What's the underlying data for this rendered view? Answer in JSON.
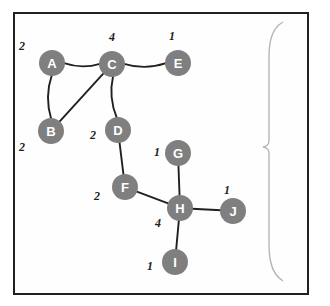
{
  "figure": {
    "side_label": "Whole graph network",
    "border_color": "#231f20",
    "node_color": "#7f7f7f",
    "node_text_color": "#ffffff",
    "edge_color": "#231f20",
    "background": "#ffffff"
  },
  "graph": {
    "type": "undirected-weighted-graph",
    "nodes": [
      {
        "id": "A",
        "label": "A",
        "x": 52,
        "y": 63,
        "degree_label": "2"
      },
      {
        "id": "B",
        "label": "B",
        "x": 51,
        "y": 131,
        "degree_label": "2"
      },
      {
        "id": "C",
        "label": "C",
        "x": 112,
        "y": 64,
        "degree_label": "4"
      },
      {
        "id": "D",
        "label": "D",
        "x": 118,
        "y": 130,
        "degree_label": "2"
      },
      {
        "id": "E",
        "label": "E",
        "x": 178,
        "y": 63,
        "degree_label": "1"
      },
      {
        "id": "F",
        "label": "F",
        "x": 125,
        "y": 187,
        "degree_label": "2"
      },
      {
        "id": "G",
        "label": "G",
        "x": 178,
        "y": 153,
        "degree_label": "1"
      },
      {
        "id": "H",
        "label": "H",
        "x": 180,
        "y": 208,
        "degree_label": "4"
      },
      {
        "id": "I",
        "label": "I",
        "x": 175,
        "y": 262,
        "degree_label": "1"
      },
      {
        "id": "J",
        "label": "J",
        "x": 233,
        "y": 211,
        "degree_label": "1"
      }
    ],
    "edges": [
      {
        "from": "A",
        "to": "C",
        "curved": true
      },
      {
        "from": "A",
        "to": "B",
        "curved": true
      },
      {
        "from": "B",
        "to": "C",
        "curved": false
      },
      {
        "from": "C",
        "to": "E",
        "curved": true
      },
      {
        "from": "C",
        "to": "D",
        "curved": true
      },
      {
        "from": "D",
        "to": "F",
        "curved": false
      },
      {
        "from": "F",
        "to": "H",
        "curved": false
      },
      {
        "from": "G",
        "to": "H",
        "curved": false
      },
      {
        "from": "H",
        "to": "J",
        "curved": false
      },
      {
        "from": "H",
        "to": "I",
        "curved": false
      }
    ],
    "node_labels": [
      {
        "node": "A",
        "value": "2",
        "x": 22,
        "y": 46
      },
      {
        "node": "C",
        "value": "4",
        "x": 112,
        "y": 37
      },
      {
        "node": "E",
        "value": "1",
        "x": 172,
        "y": 36
      },
      {
        "node": "B",
        "value": "2",
        "x": 22,
        "y": 147
      },
      {
        "node": "D",
        "value": "2",
        "x": 93,
        "y": 135
      },
      {
        "node": "G",
        "value": "1",
        "x": 157,
        "y": 152
      },
      {
        "node": "F",
        "value": "2",
        "x": 97,
        "y": 196
      },
      {
        "node": "J",
        "value": "1",
        "x": 227,
        "y": 190
      },
      {
        "node": "H",
        "value": "4",
        "x": 158,
        "y": 223
      },
      {
        "node": "I",
        "value": "1",
        "x": 150,
        "y": 266
      }
    ]
  }
}
